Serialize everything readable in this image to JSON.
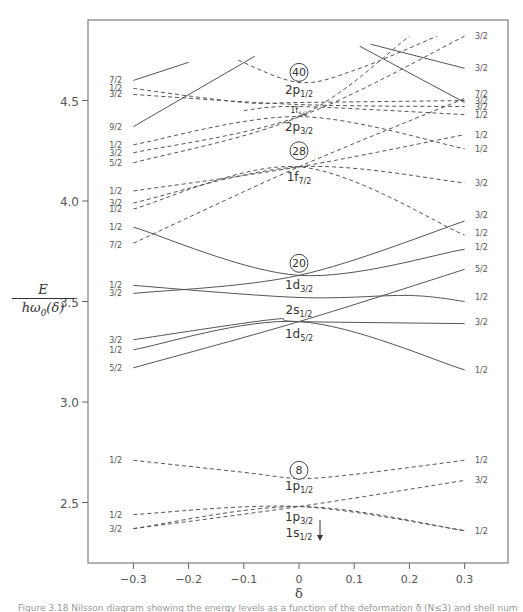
{
  "chart_data": {
    "type": "line",
    "title": "",
    "xlabel": "δ",
    "ylabel": "E / ħω0(δ)",
    "xlim": [
      -0.35,
      0.38
    ],
    "ylim": [
      2.2,
      4.85
    ],
    "x_ticks": [
      "-0.3",
      "-0.2",
      "-0.1",
      "0",
      "0.1",
      "0.2",
      "0.3"
    ],
    "y_ticks": [
      "2.5",
      "3.0",
      "3.5",
      "4.0",
      "4.5"
    ],
    "grid": false,
    "legend": "none",
    "magic_numbers": [
      "8",
      "20",
      "28",
      "40"
    ],
    "spherical_labels": [
      {
        "base": "2p",
        "sub": "1/2",
        "x": 0,
        "y": 4.55
      },
      {
        "base": "1f",
        "sub": "5/2",
        "x": 0,
        "y": 4.46
      },
      {
        "base": "2p",
        "sub": "3/2",
        "x": 0,
        "y": 4.37
      },
      {
        "base": "1f",
        "sub": "7/2",
        "x": 0,
        "y": 4.12
      },
      {
        "base": "1d",
        "sub": "3/2",
        "x": 0,
        "y": 3.58
      },
      {
        "base": "2s",
        "sub": "1/2",
        "x": 0,
        "y": 3.46
      },
      {
        "base": "1d",
        "sub": "5/2",
        "x": 0,
        "y": 3.34
      },
      {
        "base": "1p",
        "sub": "1/2",
        "x": 0,
        "y": 2.58
      },
      {
        "base": "1p",
        "sub": "3/2",
        "x": 0,
        "y": 2.43
      },
      {
        "base": "1s",
        "sub": "1/2",
        "x": 0,
        "y": 2.35
      }
    ],
    "left_omega_labels": [
      {
        "label": "7/2",
        "y": 4.6
      },
      {
        "label": "1/2",
        "y": 4.56
      },
      {
        "label": "3/2",
        "y": 4.53
      },
      {
        "label": "9/2",
        "y": 4.37
      },
      {
        "label": "1/2",
        "y": 4.28
      },
      {
        "label": "3/2",
        "y": 4.24
      },
      {
        "label": "5/2",
        "y": 4.19
      },
      {
        "label": "1/2",
        "y": 4.05
      },
      {
        "label": "3/2",
        "y": 3.99
      },
      {
        "label": "1/2",
        "y": 3.96
      },
      {
        "label": "1/2",
        "y": 3.87
      },
      {
        "label": "7/2",
        "y": 3.78
      },
      {
        "label": "1/2",
        "y": 3.58
      },
      {
        "label": "3/2",
        "y": 3.54
      },
      {
        "label": "3/2",
        "y": 3.31
      },
      {
        "label": "1/2",
        "y": 3.26
      },
      {
        "label": "5/2",
        "y": 3.17
      },
      {
        "label": "1/2",
        "y": 2.71
      },
      {
        "label": "1/2",
        "y": 2.44
      },
      {
        "label": "3/2",
        "y": 2.37
      }
    ],
    "right_omega_labels": [
      {
        "label": "3/2",
        "y": 4.82
      },
      {
        "label": "3/2",
        "y": 4.66
      },
      {
        "label": "7/2",
        "y": 4.53
      },
      {
        "label": "3/2",
        "y": 4.5
      },
      {
        "label": "3/2",
        "y": 4.47
      },
      {
        "label": "1/2",
        "y": 4.43
      },
      {
        "label": "1/2",
        "y": 4.33
      },
      {
        "label": "1/2",
        "y": 4.26
      },
      {
        "label": "3/2",
        "y": 4.09
      },
      {
        "label": "3/2",
        "y": 3.93
      },
      {
        "label": "1/2",
        "y": 3.84
      },
      {
        "label": "1/2",
        "y": 3.77
      },
      {
        "label": "5/2",
        "y": 3.66
      },
      {
        "label": "1/2",
        "y": 3.52
      },
      {
        "label": "3/2",
        "y": 3.4
      },
      {
        "label": "1/2",
        "y": 3.16
      },
      {
        "label": "1/2",
        "y": 2.71
      },
      {
        "label": "3/2",
        "y": 2.61
      },
      {
        "label": "1/2",
        "y": 2.36
      }
    ],
    "series": [
      {
        "name": "1s1/2 [1/2]",
        "style": "dashed",
        "x": [
          -0.3,
          0,
          0.3
        ],
        "y": [
          2.37,
          2.48,
          2.36
        ]
      },
      {
        "name": "1p3/2 [3/2]",
        "style": "dashed",
        "x": [
          -0.3,
          0,
          0.3
        ],
        "y": [
          2.37,
          2.48,
          2.61
        ]
      },
      {
        "name": "1p3/2 [1/2]",
        "style": "dashed",
        "x": [
          -0.3,
          0,
          0.3
        ],
        "y": [
          2.44,
          2.48,
          2.36
        ]
      },
      {
        "name": "1p1/2 [1/2]",
        "style": "dashed",
        "x": [
          -0.3,
          -0.1,
          0,
          0.1,
          0.3
        ],
        "y": [
          2.71,
          2.65,
          2.62,
          2.64,
          2.71
        ]
      },
      {
        "name": "1d5/2 [5/2]",
        "style": "solid",
        "x": [
          -0.3,
          0,
          0.3
        ],
        "y": [
          3.17,
          3.4,
          3.66
        ]
      },
      {
        "name": "1d5/2 [1/2]",
        "style": "solid",
        "x": [
          -0.3,
          0,
          0.3
        ],
        "y": [
          3.26,
          3.4,
          3.16
        ]
      },
      {
        "name": "1d5/2 [3/2]",
        "style": "solid",
        "x": [
          -0.3,
          -0.05,
          0,
          0.3
        ],
        "y": [
          3.31,
          3.41,
          3.4,
          3.39
        ]
      },
      {
        "name": "2s1/2 [1/2]",
        "style": "solid",
        "x": [
          -0.3,
          0,
          0.2,
          0.3
        ],
        "y": [
          3.58,
          3.52,
          3.53,
          3.5
        ]
      },
      {
        "name": "1d3/2 [3/2]",
        "style": "solid",
        "x": [
          -0.3,
          0,
          0.3
        ],
        "y": [
          3.54,
          3.63,
          3.9
        ]
      },
      {
        "name": "1d3/2 [1/2]",
        "style": "solid",
        "x": [
          -0.3,
          0,
          0.3
        ],
        "y": [
          3.87,
          3.63,
          3.76
        ]
      },
      {
        "name": "1f7/2 [7/2]",
        "style": "dashed",
        "x": [
          -0.3,
          0,
          0.3
        ],
        "y": [
          3.79,
          4.17,
          4.51
        ]
      },
      {
        "name": "1f7/2 [1/2]",
        "style": "dashed",
        "x": [
          -0.3,
          0,
          0.3
        ],
        "y": [
          3.96,
          4.17,
          3.83
        ]
      },
      {
        "name": "1f7/2 [3/2]",
        "style": "dashed",
        "x": [
          -0.3,
          0,
          0.3
        ],
        "y": [
          3.99,
          4.17,
          4.09
        ]
      },
      {
        "name": "1f7/2 [5/2]",
        "style": "dashed",
        "x": [
          -0.3,
          0,
          0.3
        ],
        "y": [
          4.05,
          4.17,
          4.33
        ]
      },
      {
        "name": "2p3/2 [5/2]",
        "style": "dashed",
        "x": [
          -0.3,
          0,
          0.2
        ],
        "y": [
          4.19,
          4.42,
          4.82
        ]
      },
      {
        "name": "2p3/2 [3/2]",
        "style": "dashed",
        "x": [
          -0.3,
          0,
          0.3
        ],
        "y": [
          4.24,
          4.42,
          4.82
        ]
      },
      {
        "name": "2p3/2 [1/2]",
        "style": "dashed",
        "x": [
          -0.3,
          0,
          0.3
        ],
        "y": [
          4.28,
          4.42,
          4.26
        ]
      },
      {
        "name": "9/2",
        "style": "solid",
        "x": [
          -0.3,
          -0.08
        ],
        "y": [
          4.37,
          4.72
        ]
      },
      {
        "name": "7/2 left",
        "style": "solid",
        "x": [
          -0.3,
          -0.2
        ],
        "y": [
          4.6,
          4.69
        ]
      },
      {
        "name": "3/2 top",
        "style": "solid",
        "x": [
          0.13,
          0.3
        ],
        "y": [
          4.78,
          4.66
        ]
      },
      {
        "name": "7/2 top",
        "style": "solid",
        "x": [
          0.11,
          0.3
        ],
        "y": [
          4.77,
          4.49
        ]
      },
      {
        "name": "2p1/2 [1/2]",
        "style": "dashed",
        "x": [
          -0.3,
          -0.1,
          0,
          0.3
        ],
        "y": [
          4.56,
          4.49,
          4.49,
          4.5
        ]
      },
      {
        "name": "1f5/2 [3/2]",
        "style": "dashed",
        "x": [
          -0.3,
          0,
          0.3
        ],
        "y": [
          4.53,
          4.48,
          4.47
        ]
      },
      {
        "name": "40 dome",
        "style": "dashed",
        "x": [
          -0.11,
          0,
          0.1,
          0.25
        ],
        "y": [
          4.7,
          4.59,
          4.65,
          4.82
        ]
      },
      {
        "name": "2p1/2 right [1/2]",
        "style": "dashed",
        "x": [
          -0.1,
          0,
          0.3
        ],
        "y": [
          4.45,
          4.47,
          4.43
        ]
      }
    ]
  },
  "caption": {
    "text": "Figure 3.18  Nilsson diagram showing the energy levels as a function of the deformation δ (N≤3) and shell numbers"
  }
}
